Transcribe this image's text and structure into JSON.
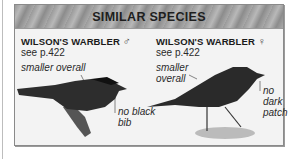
{
  "header": {
    "title": "SIMILAR SPECIES"
  },
  "species": [
    {
      "name": "WILSON'S WARBLER",
      "sex_symbol": "♂",
      "page_ref": "see p.422",
      "annotations": [
        {
          "text": "smaller overall"
        },
        {
          "text": "no black bib",
          "lines": [
            "no black",
            "bib"
          ]
        }
      ]
    },
    {
      "name": "WILSON'S WARBLER",
      "sex_symbol": "♀",
      "page_ref": "see p.422",
      "annotations": [
        {
          "text": "smaller overall",
          "lines": [
            "smaller",
            "overall"
          ]
        },
        {
          "text": "no dark patch",
          "lines": [
            "no",
            "dark",
            "patch"
          ]
        }
      ]
    }
  ]
}
